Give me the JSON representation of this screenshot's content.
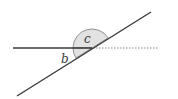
{
  "diagram": {
    "type": "geometry-angles",
    "angles": [
      {
        "label": "b",
        "position": "below horizontal, left of transversal"
      },
      {
        "label": "c",
        "position": "above horizontal, left of transversal"
      }
    ],
    "colors": {
      "line": "#3a3a3a",
      "dotted": "#8a8a8a",
      "sector_fill": "#e2e2e2",
      "sector_stroke": "#7a7a7a"
    }
  }
}
